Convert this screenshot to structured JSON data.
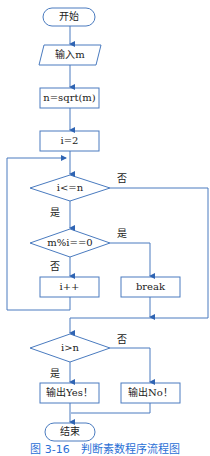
{
  "diagram": {
    "type": "flowchart",
    "colors": {
      "stroke": "#4a7bbf",
      "arrow": "#2f64b3",
      "text": "#222222",
      "caption": "#2a6fd6"
    },
    "nodes": {
      "start": "开始",
      "input": "输入m",
      "sqrt": "n=sqrt(m)",
      "init": "i=2",
      "cond_loop": "i<=n",
      "cond_mod": "m%i==0",
      "inc": "i++",
      "brk": "break",
      "cond_final": "i>n",
      "out_yes": "输出Yes！",
      "out_no": "输出No！",
      "end": "结束"
    },
    "edge_labels": {
      "loop_no": "否",
      "loop_yes": "是",
      "mod_yes": "是",
      "mod_no": "否",
      "final_no": "否",
      "final_yes": "是"
    },
    "caption": "图 3-16　判断素数程序流程图"
  }
}
